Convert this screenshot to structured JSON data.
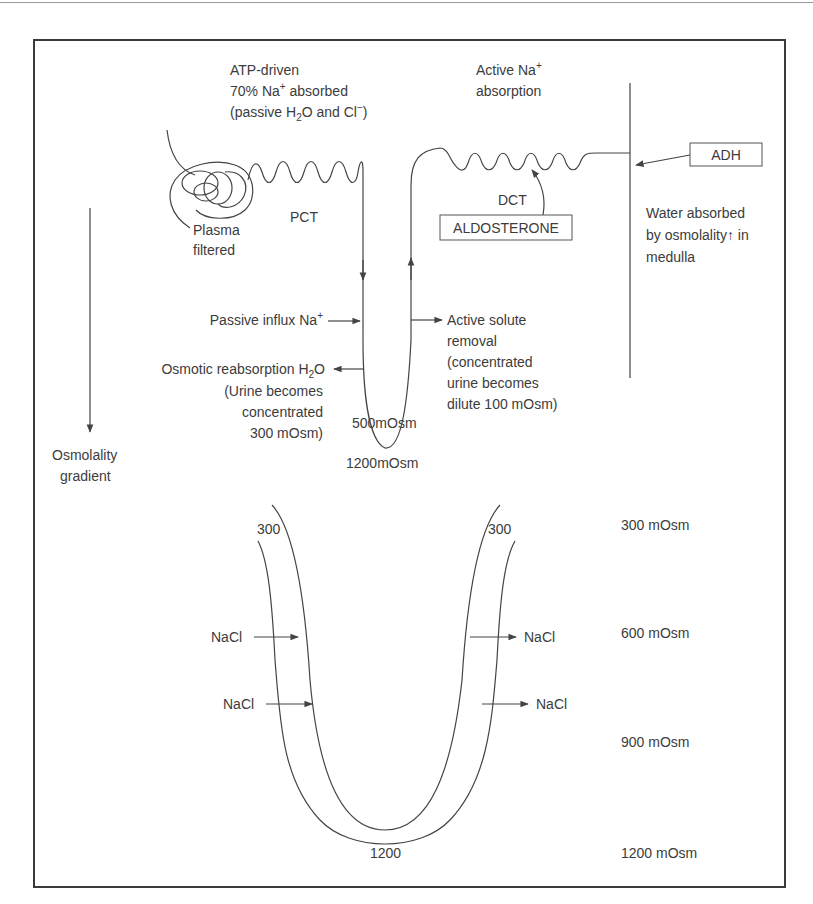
{
  "figure": {
    "colors": {
      "line": "#444444",
      "text": "#3c3c3c",
      "frame": "#3a3a3a",
      "background": "#ffffff"
    },
    "upper_panel": {
      "pct_note": {
        "line1": "ATP-driven",
        "line2_prefix": "70% Na",
        "line2_sup": "+",
        "line2_suffix": " absorbed",
        "line3_prefix": "(passive H",
        "line3_sub": "2",
        "line3_mid": "O and Cl",
        "line3_sup": "−",
        "line3_suffix": ")"
      },
      "dct_note": {
        "line1_prefix": "Active Na",
        "line1_sup": "+",
        "line2": "absorption"
      },
      "glomerulus_label": {
        "line1": "Plasma",
        "line2": "filtered"
      },
      "pct_label": "PCT",
      "dct_label": "DCT",
      "aldosterone_box": "ALDOSTERONE",
      "adh_box": "ADH",
      "collecting_duct_note": {
        "line1": "Water absorbed",
        "line2": "by osmolality↑ in",
        "line3": "medulla"
      },
      "descending_limb": {
        "passive_influx_prefix": "Passive influx Na",
        "passive_influx_sup": "+",
        "osmotic_prefix": "Osmotic reabsorption H",
        "osmotic_sub": "2",
        "osmotic_suffix": "O",
        "urine_line1": "(Urine becomes",
        "urine_line2": "concentrated",
        "urine_line3": "300 mOsm)"
      },
      "ascending_limb": {
        "line1": "Active solute",
        "line2": "removal",
        "line3": "(concentrated",
        "line4": "urine becomes",
        "line5": "dilute 100 mOsm)"
      },
      "loop_inner_label": "500mOsm",
      "loop_bottom_label": "1200mOsm",
      "gradient_label": {
        "line1": "Osmolality",
        "line2": "gradient"
      }
    },
    "lower_panel": {
      "left_top_value": "300",
      "right_top_value": "300",
      "bottom_value": "1200",
      "nacl_in": [
        "NaCl",
        "NaCl"
      ],
      "nacl_out": [
        "NaCl",
        "NaCl"
      ],
      "scale": [
        "300 mOsm",
        "600 mOsm",
        "900 mOsm",
        "1200 mOsm"
      ]
    }
  }
}
